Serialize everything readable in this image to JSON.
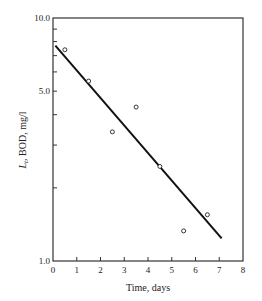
{
  "chart_data": {
    "type": "scatter",
    "title": "",
    "xlabel": "Time, days",
    "ylabel": "L_t, BOD, mg/l",
    "ylabel_parts": {
      "symbol": "L",
      "subscript": "t",
      "rest": ", BOD, mg/l"
    },
    "xlim": [
      0,
      8
    ],
    "ylim": [
      1.0,
      10.0
    ],
    "yscale": "log",
    "grid": false,
    "legend": null,
    "x_ticks": [
      0,
      1,
      2,
      3,
      4,
      5,
      6,
      7,
      8
    ],
    "x_tick_labels": [
      "0",
      "1",
      "2",
      "3",
      "4",
      "5",
      "6",
      "7",
      "8"
    ],
    "y_tick_labels": [
      {
        "value": 10.0,
        "label": "10.0"
      },
      {
        "value": 5.0,
        "label": "5.0"
      },
      {
        "value": 1.0,
        "label": "1.0"
      }
    ],
    "y_minor_ticks": [
      2,
      3,
      4,
      6,
      7,
      8,
      9
    ],
    "series": [
      {
        "name": "Observed BOD",
        "type": "scatter",
        "marker": "open-circle",
        "x": [
          0.5,
          1.5,
          2.5,
          3.5,
          4.5,
          5.5,
          6.5
        ],
        "y": [
          7.4,
          5.5,
          3.4,
          4.3,
          2.45,
          1.33,
          1.55
        ]
      },
      {
        "name": "Fitted line",
        "type": "line",
        "x": [
          0.1,
          7.1
        ],
        "y": [
          7.7,
          1.24
        ]
      }
    ]
  }
}
